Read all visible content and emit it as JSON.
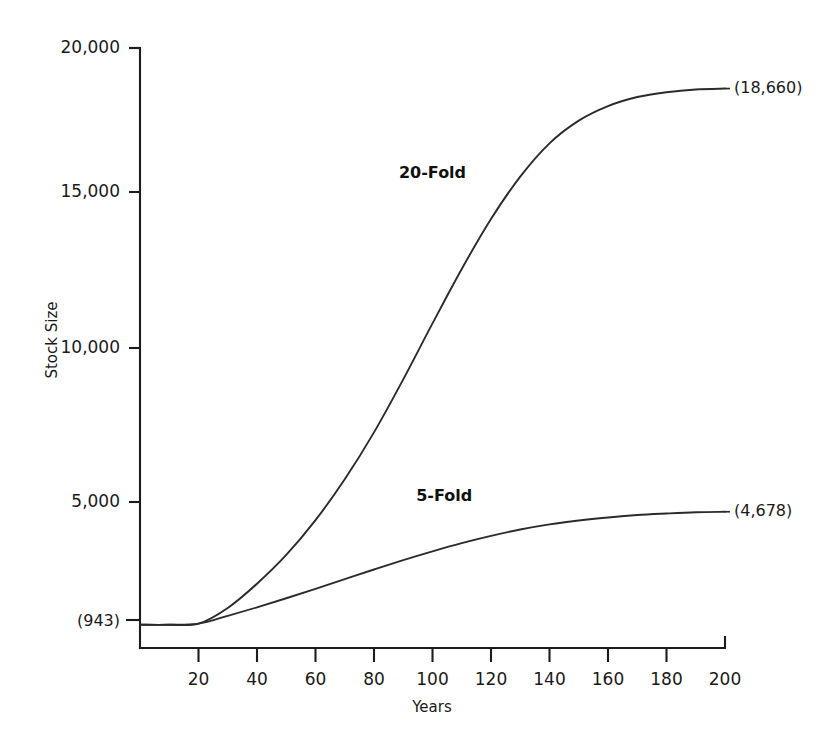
{
  "chart_data": {
    "type": "line",
    "title": "",
    "xlabel": "Years",
    "ylabel": "Stock Size",
    "xlim": [
      0,
      200
    ],
    "ylim": [
      943,
      20000
    ],
    "grid": false,
    "legend_position": "inline-annotation",
    "x_ticks": [
      20,
      40,
      60,
      80,
      100,
      120,
      140,
      160,
      180,
      200
    ],
    "x_tick_labels": [
      "20",
      "40",
      "60",
      "80",
      "100",
      "120",
      "140",
      "160",
      "180",
      "200"
    ],
    "y_ticks": [
      5000,
      10000,
      15000,
      20000
    ],
    "y_tick_labels": [
      "5,000",
      "10,000",
      "15,000",
      "20,000"
    ],
    "origin_label": "(943)",
    "origin_value": 943,
    "series": [
      {
        "name": "20-Fold",
        "label": "20-Fold",
        "label_x": 100,
        "label_y": 15700,
        "endpoint_label": "(18,660)",
        "endpoint_value": 18660,
        "x": [
          0,
          10,
          20,
          30,
          40,
          50,
          60,
          70,
          80,
          90,
          100,
          110,
          120,
          130,
          140,
          150,
          160,
          170,
          180,
          190,
          200
        ],
        "values": [
          943,
          943,
          980,
          1500,
          2300,
          3250,
          4400,
          5750,
          7300,
          9050,
          10900,
          12700,
          14350,
          15750,
          16850,
          17600,
          18080,
          18380,
          18540,
          18630,
          18660
        ]
      },
      {
        "name": "5-Fold",
        "label": "5-Fold",
        "label_x": 104,
        "label_y": 5050,
        "endpoint_label": "(4,678)",
        "endpoint_value": 4678,
        "x": [
          0,
          10,
          20,
          30,
          40,
          50,
          60,
          70,
          80,
          90,
          100,
          110,
          120,
          130,
          140,
          150,
          160,
          170,
          180,
          190,
          200
        ],
        "values": [
          943,
          943,
          980,
          1240,
          1520,
          1820,
          2130,
          2450,
          2770,
          3080,
          3370,
          3640,
          3880,
          4090,
          4260,
          4390,
          4490,
          4570,
          4620,
          4660,
          4678
        ]
      }
    ]
  },
  "colors": {
    "background": "#ffffff",
    "axis": "#1c1c1c",
    "curve": "#2b2b2b",
    "text": "#1a1a1a"
  }
}
